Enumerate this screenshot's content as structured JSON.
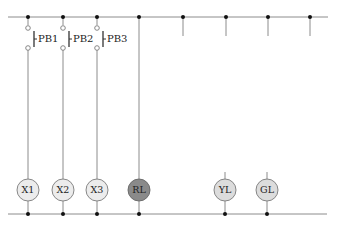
{
  "diagram": {
    "type": "ladder-circuit",
    "colors": {
      "wire": "#8c8c8c",
      "node": "#111111",
      "coil_fill": "#ececec",
      "lamp_fill": "#dcdcdc",
      "relay_fill": "#8a8a8a",
      "outline": "#7a7a7a"
    },
    "switches": [
      {
        "label": "PB1"
      },
      {
        "label": "PB2"
      },
      {
        "label": "PB3"
      }
    ],
    "loads": [
      {
        "label": "X1",
        "kind": "coil"
      },
      {
        "label": "X2",
        "kind": "coil"
      },
      {
        "label": "X3",
        "kind": "coil"
      },
      {
        "label": "RL",
        "kind": "relay-lamp"
      },
      {
        "label": "YL",
        "kind": "lamp"
      },
      {
        "label": "GL",
        "kind": "lamp"
      }
    ]
  }
}
